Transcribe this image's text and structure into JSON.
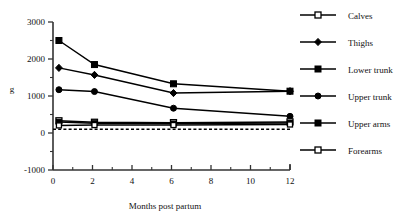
{
  "chart_data": {
    "type": "line",
    "title": "",
    "xlabel": "Months post partum",
    "ylabel": "g",
    "xlim": [
      0,
      12
    ],
    "ylim": [
      -1000,
      3000
    ],
    "x_ticks": [
      0,
      2,
      4,
      6,
      8,
      10,
      12
    ],
    "x_tick_labels": [
      "0",
      "2",
      "4",
      "6",
      "8",
      "10",
      "12"
    ],
    "x_minor_ticks": [
      1,
      3,
      5,
      7,
      9,
      11
    ],
    "y_ticks": [
      -1000,
      0,
      1000,
      2000,
      3000
    ],
    "y_tick_labels": [
      "-1000",
      "0",
      "1000",
      "2000",
      "3000"
    ],
    "y_minor_ticks": [
      -500,
      500,
      1500,
      2500
    ],
    "grid": false,
    "legend_position": "right",
    "x": [
      0.3,
      2.1,
      6.1,
      12.0
    ],
    "reference_line": {
      "name": "zero-reference",
      "style": "dashed",
      "y": 100
    },
    "series": [
      {
        "name": "Lower trunk",
        "marker": "filled-square",
        "values": [
          2500,
          1850,
          1330,
          1130
        ]
      },
      {
        "name": "Thighs",
        "marker": "filled-diamond",
        "values": [
          1760,
          1570,
          1080,
          1130
        ]
      },
      {
        "name": "Upper trunk",
        "marker": "filled-circle",
        "values": [
          1170,
          1120,
          670,
          450
        ]
      },
      {
        "name": "Calves",
        "marker": "open-square",
        "values": [
          330,
          290,
          280,
          300
        ]
      },
      {
        "name": "Upper arms",
        "marker": "filled-square-small",
        "values": [
          300,
          265,
          255,
          270
        ]
      },
      {
        "name": "Forearms",
        "marker": "open-square-small",
        "values": [
          205,
          215,
          215,
          230
        ]
      }
    ]
  },
  "legend": {
    "items": [
      {
        "label": "Calves",
        "marker": "open-square"
      },
      {
        "label": "Thighs",
        "marker": "filled-diamond"
      },
      {
        "label": "Lower trunk",
        "marker": "filled-square"
      },
      {
        "label": "Upper trunk",
        "marker": "filled-circle"
      },
      {
        "label": "Upper arms",
        "marker": "filled-square"
      },
      {
        "label": "Forearms",
        "marker": "open-square"
      }
    ]
  },
  "axes": {
    "y_title": "g",
    "x_title": "Months post partum"
  },
  "colors": {
    "ink": "#000000",
    "axis": "#333333",
    "background": "#ffffff"
  }
}
